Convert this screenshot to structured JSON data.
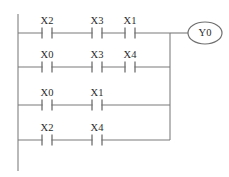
{
  "diagram": {
    "type": "ladder-logic",
    "title_visible": false,
    "colors": {
      "wire": "#7a7a7a",
      "rail": "#8a8a8a",
      "contact": "#6f6f6f",
      "text": "#2b2b2b",
      "coil_outline": "#6f6f6f",
      "background": "#ffffff"
    },
    "left_rail": {
      "x": 18,
      "y_top": 14,
      "y_bottom": 171
    },
    "right_rail": {
      "x": 170,
      "y_top": 33,
      "y_bottom": 140
    },
    "coil": {
      "label": "Y0",
      "cx": 205,
      "cy": 33,
      "rx": 17,
      "ry": 11,
      "lead_from_x": 170
    },
    "rungs": [
      {
        "name": "rung-1",
        "y": 33,
        "contacts": [
          {
            "label": "X2",
            "x": 47,
            "type": "normally-open"
          },
          {
            "label": "X3",
            "x": 97,
            "type": "normally-open"
          },
          {
            "label": "X1",
            "x": 130,
            "type": "normally-open"
          }
        ]
      },
      {
        "name": "rung-2",
        "y": 67,
        "contacts": [
          {
            "label": "X0",
            "x": 47,
            "type": "normally-open"
          },
          {
            "label": "X3",
            "x": 97,
            "type": "normally-open"
          },
          {
            "label": "X4",
            "x": 130,
            "type": "normally-open"
          }
        ]
      },
      {
        "name": "rung-3",
        "y": 105,
        "contacts": [
          {
            "label": "X0",
            "x": 47,
            "type": "normally-open"
          },
          {
            "label": "X1",
            "x": 97,
            "type": "normally-open"
          }
        ]
      },
      {
        "name": "rung-4",
        "y": 140,
        "contacts": [
          {
            "label": "X2",
            "x": 47,
            "type": "normally-open"
          },
          {
            "label": "X4",
            "x": 97,
            "type": "normally-open"
          }
        ]
      }
    ]
  }
}
